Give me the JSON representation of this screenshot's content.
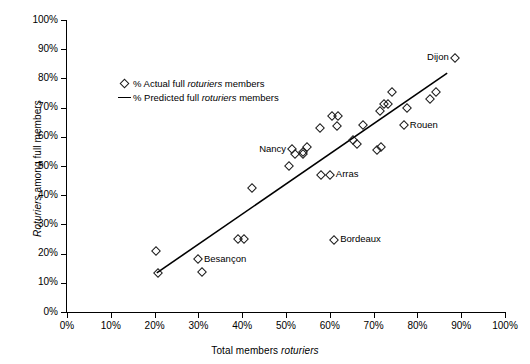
{
  "chart_data": {
    "type": "scatter",
    "title": "",
    "xlabel": "Total members roturiers",
    "ylabel": "Roturiers among full members",
    "xlim": [
      0,
      100
    ],
    "ylim": [
      0,
      100
    ],
    "grid": false,
    "legend_position": "upper-left-inside",
    "x_ticks": [
      "0%",
      "10%",
      "20%",
      "30%",
      "40%",
      "50%",
      "60%",
      "70%",
      "80%",
      "90%",
      "100%"
    ],
    "y_ticks": [
      "0%",
      "10%",
      "20%",
      "30%",
      "40%",
      "50%",
      "60%",
      "70%",
      "80%",
      "90%",
      "100%"
    ],
    "series": [
      {
        "name": "% Actual full roturiers members",
        "type": "scatter",
        "marker": "open-diamond",
        "color": "#1a1a1a",
        "points": [
          {
            "x": 20.3,
            "y": 20.9,
            "label": ""
          },
          {
            "x": 20.8,
            "y": 13.4,
            "label": ""
          },
          {
            "x": 29.9,
            "y": 18.0,
            "label": "Besançon"
          },
          {
            "x": 30.8,
            "y": 13.7,
            "label": ""
          },
          {
            "x": 39.0,
            "y": 25.0,
            "label": ""
          },
          {
            "x": 40.4,
            "y": 25.0,
            "label": ""
          },
          {
            "x": 42.2,
            "y": 42.5,
            "label": ""
          },
          {
            "x": 50.7,
            "y": 50.0,
            "label": ""
          },
          {
            "x": 51.4,
            "y": 55.8,
            "label": ""
          },
          {
            "x": 52.1,
            "y": 54.0,
            "label": ""
          },
          {
            "x": 53.9,
            "y": 54.8,
            "label": ""
          },
          {
            "x": 53.9,
            "y": 54.0,
            "label": ""
          },
          {
            "x": 54.8,
            "y": 56.5,
            "label": ""
          },
          {
            "x": 57.8,
            "y": 63.0,
            "label": ""
          },
          {
            "x": 58.0,
            "y": 47.0,
            "label": ""
          },
          {
            "x": 60.0,
            "y": 47.0,
            "label": "Arras"
          },
          {
            "x": 60.5,
            "y": 67.0,
            "label": ""
          },
          {
            "x": 61.9,
            "y": 67.0,
            "label": ""
          },
          {
            "x": 61.6,
            "y": 63.8,
            "label": ""
          },
          {
            "x": 61.0,
            "y": 24.7,
            "label": "Bordeaux"
          },
          {
            "x": 65.3,
            "y": 59.0,
            "label": ""
          },
          {
            "x": 66.2,
            "y": 57.5,
            "label": ""
          },
          {
            "x": 67.6,
            "y": 64.0,
            "label": ""
          },
          {
            "x": 70.8,
            "y": 55.5,
            "label": ""
          },
          {
            "x": 71.7,
            "y": 56.5,
            "label": ""
          },
          {
            "x": 71.5,
            "y": 68.8,
            "label": ""
          },
          {
            "x": 72.4,
            "y": 71.2,
            "label": ""
          },
          {
            "x": 73.3,
            "y": 71.2,
            "label": ""
          },
          {
            "x": 74.2,
            "y": 75.4,
            "label": ""
          },
          {
            "x": 76.9,
            "y": 64.0,
            "label": "Rouen"
          },
          {
            "x": 77.6,
            "y": 70.0,
            "label": ""
          },
          {
            "x": 82.9,
            "y": 73.0,
            "label": ""
          },
          {
            "x": 84.2,
            "y": 75.4,
            "label": ""
          },
          {
            "x": 88.6,
            "y": 87.0,
            "label": "Dijon"
          }
        ]
      },
      {
        "name": "% Predicted full roturiers members",
        "type": "line",
        "color": "#000000",
        "x": [
          20.5,
          86.8
        ],
        "y": [
          13.4,
          81.8
        ]
      }
    ],
    "annotations": [
      {
        "text": "Nancy",
        "x": 51.4,
        "y": 55.8,
        "placement": "left"
      },
      {
        "text": "Arras",
        "x": 60.0,
        "y": 47.0,
        "placement": "right"
      },
      {
        "text": "Besançon",
        "x": 29.9,
        "y": 18.0,
        "placement": "right"
      },
      {
        "text": "Bordeaux",
        "x": 61.0,
        "y": 24.7,
        "placement": "right"
      },
      {
        "text": "Rouen",
        "x": 76.9,
        "y": 64.0,
        "placement": "right"
      },
      {
        "text": "Dijon",
        "x": 88.6,
        "y": 87.0,
        "placement": "left"
      }
    ]
  },
  "legend": {
    "items": [
      {
        "key": "open-diamond",
        "prefix": "% Actual full ",
        "emphasis": "roturiers",
        "suffix": " members"
      },
      {
        "key": "line",
        "prefix": "% Predicted full ",
        "emphasis": "roturiers",
        "suffix": " members"
      }
    ]
  },
  "axis_titles": {
    "x_prefix": "Total members ",
    "x_emphasis": "roturiers",
    "x_suffix": "",
    "y_emphasis": "Roturiers",
    "y_suffix": " among full members"
  }
}
